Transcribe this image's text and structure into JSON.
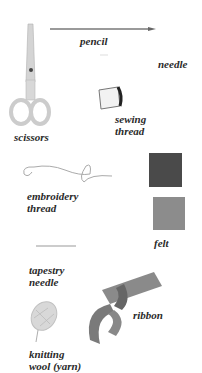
{
  "items": [
    {
      "id": "pencil",
      "label": "pencil"
    },
    {
      "id": "needle",
      "label": "needle"
    },
    {
      "id": "scissors",
      "label": "scissors"
    },
    {
      "id": "sewing_thread",
      "label": "sewing\nthread"
    },
    {
      "id": "embroidery_thread",
      "label": "embroidery\nthread"
    },
    {
      "id": "felt",
      "label": "felt"
    },
    {
      "id": "tapestry_needle",
      "label": "tapestry\nneedle"
    },
    {
      "id": "ribbon",
      "label": "ribbon"
    },
    {
      "id": "knitting_wool",
      "label": "knitting\nwool (yarn)"
    }
  ],
  "colors": {
    "felt_dark": "#4a4a4a",
    "felt_light": "#8c8c8c",
    "ribbon": "#7a7a7a",
    "label_text": "#2a2a2a"
  }
}
